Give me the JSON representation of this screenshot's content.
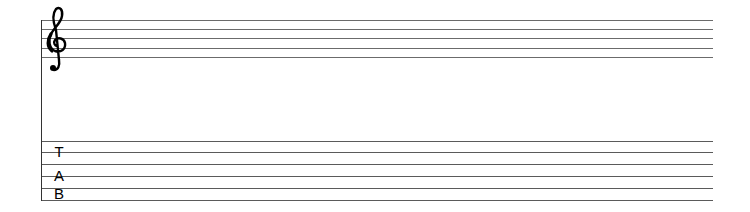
{
  "score": {
    "clef": "treble-clef",
    "clef_glyph": "𝄞",
    "tab_label": [
      "T",
      "A",
      "B"
    ],
    "staff": {
      "line_count": 5,
      "line_y": [
        20,
        29,
        38,
        48,
        57
      ],
      "x_start": 41,
      "x_end": 713
    },
    "tab_staff": {
      "line_count": 6,
      "line_y": [
        141,
        152,
        164,
        176,
        188,
        200
      ],
      "x_start": 41,
      "x_end": 713
    },
    "colors": {
      "line": "#555555",
      "ink": "#000000"
    }
  }
}
